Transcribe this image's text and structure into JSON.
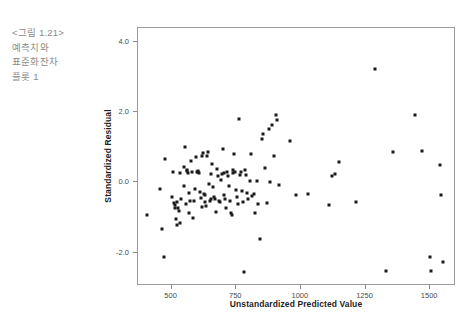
{
  "caption": {
    "text": "<그림 1.21>\n예측치와\n표준화잔차\n플롯 1"
  },
  "chart_data": {
    "type": "scatter",
    "title": "",
    "xlabel": "Unstandardized Predicted Value",
    "ylabel": "Standardized Residual",
    "xlim": [
      370,
      1600
    ],
    "ylim": [
      -2.95,
      4.4
    ],
    "xticks": [
      500,
      750,
      1000,
      1250,
      1500
    ],
    "xtick_labels": [
      "500",
      "750",
      "1000",
      "1250",
      "1500"
    ],
    "yticks": [
      4.0,
      2.0,
      0.0,
      -2.0
    ],
    "ytick_labels": [
      "4.0",
      "2.0",
      "0.0",
      "-2.0"
    ],
    "grid": false,
    "legend": null,
    "marker_color": "#1a1a1a",
    "frame_color": "#9a9a9a",
    "points": [
      [
        404,
        -0.93
      ],
      [
        455,
        -0.19
      ],
      [
        462,
        -1.32
      ],
      [
        472,
        -2.12
      ],
      [
        476,
        0.66
      ],
      [
        500,
        -0.42
      ],
      [
        506,
        0.31
      ],
      [
        511,
        -0.59
      ],
      [
        512,
        -0.63
      ],
      [
        513,
        -0.73
      ],
      [
        516,
        -1.04
      ],
      [
        519,
        -1.21
      ],
      [
        521,
        -0.57
      ],
      [
        524,
        -0.72
      ],
      [
        527,
        -0.81
      ],
      [
        531,
        -1.16
      ],
      [
        534,
        0.28
      ],
      [
        538,
        -0.46
      ],
      [
        546,
        0.45
      ],
      [
        548,
        -0.11
      ],
      [
        551,
        1.02
      ],
      [
        556,
        -0.62
      ],
      [
        558,
        0.33
      ],
      [
        561,
        0.35
      ],
      [
        563,
        0.26
      ],
      [
        566,
        -0.31
      ],
      [
        569,
        -0.88
      ],
      [
        572,
        -0.54
      ],
      [
        575,
        0.62
      ],
      [
        578,
        0.31
      ],
      [
        583,
        -1.02
      ],
      [
        586,
        -0.52
      ],
      [
        591,
        -0.18
      ],
      [
        594,
        0.72
      ],
      [
        598,
        0.29
      ],
      [
        601,
        0.33
      ],
      [
        604,
        0.3
      ],
      [
        606,
        0.28
      ],
      [
        609,
        -0.28
      ],
      [
        612,
        -0.44
      ],
      [
        616,
        -0.71
      ],
      [
        619,
        0.76
      ],
      [
        622,
        0.85
      ],
      [
        625,
        -0.33
      ],
      [
        628,
        -0.36
      ],
      [
        631,
        -0.57
      ],
      [
        634,
        -0.66
      ],
      [
        637,
        0.74
      ],
      [
        641,
        0.86
      ],
      [
        644,
        -0.04
      ],
      [
        647,
        -0.52
      ],
      [
        651,
        -0.48
      ],
      [
        654,
        0.23
      ],
      [
        658,
        0.52
      ],
      [
        661,
        -0.12
      ],
      [
        664,
        -0.42
      ],
      [
        668,
        -0.46
      ],
      [
        671,
        -0.83
      ],
      [
        676,
        0.37
      ],
      [
        679,
        0.17
      ],
      [
        683,
        -0.52
      ],
      [
        687,
        -0.57
      ],
      [
        691,
        0.07
      ],
      [
        694,
        0.24
      ],
      [
        698,
        0.94
      ],
      [
        701,
        0.28
      ],
      [
        704,
        -0.36
      ],
      [
        708,
        -0.46
      ],
      [
        712,
        -0.72
      ],
      [
        716,
        0.31
      ],
      [
        719,
        0.18
      ],
      [
        722,
        -0.11
      ],
      [
        726,
        -0.53
      ],
      [
        729,
        -0.87
      ],
      [
        733,
        -0.92
      ],
      [
        736,
        0.28
      ],
      [
        739,
        0.36
      ],
      [
        742,
        0.82
      ],
      [
        746,
        0.31
      ],
      [
        749,
        -0.21
      ],
      [
        753,
        -0.41
      ],
      [
        757,
        -0.62
      ],
      [
        761,
        1.82
      ],
      [
        764,
        0.22
      ],
      [
        768,
        0.3
      ],
      [
        772,
        -0.24
      ],
      [
        775,
        -0.55
      ],
      [
        779,
        -2.54
      ],
      [
        784,
        0.36
      ],
      [
        788,
        0.21
      ],
      [
        792,
        -0.3
      ],
      [
        796,
        -0.48
      ],
      [
        802,
        0.03
      ],
      [
        806,
        0.81
      ],
      [
        812,
        -0.39
      ],
      [
        818,
        -0.33
      ],
      [
        824,
        -0.86
      ],
      [
        829,
        0.05
      ],
      [
        836,
        -0.62
      ],
      [
        842,
        -1.62
      ],
      [
        848,
        1.25
      ],
      [
        855,
        1.38
      ],
      [
        862,
        0.41
      ],
      [
        868,
        -0.58
      ],
      [
        876,
        1.52
      ],
      [
        882,
        0.02
      ],
      [
        889,
        1.64
      ],
      [
        895,
        0.76
      ],
      [
        902,
        1.92
      ],
      [
        908,
        1.78
      ],
      [
        915,
        -0.06
      ],
      [
        958,
        1.18
      ],
      [
        982,
        -0.36
      ],
      [
        1026,
        -0.34
      ],
      [
        1108,
        -0.63
      ],
      [
        1122,
        0.17
      ],
      [
        1132,
        0.25
      ],
      [
        1148,
        0.58
      ],
      [
        1215,
        -0.55
      ],
      [
        1288,
        3.22
      ],
      [
        1330,
        -2.52
      ],
      [
        1358,
        0.88
      ],
      [
        1440,
        1.92
      ],
      [
        1468,
        0.89
      ],
      [
        1500,
        -2.13
      ],
      [
        1502,
        -2.52
      ],
      [
        1538,
        0.51
      ],
      [
        1542,
        -0.37
      ],
      [
        1548,
        -2.28
      ]
    ]
  }
}
